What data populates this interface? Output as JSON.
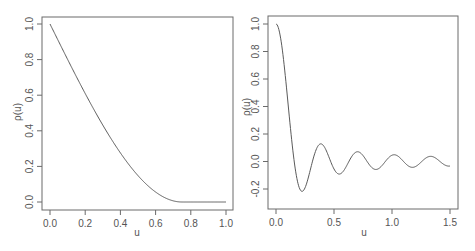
{
  "chart_data": [
    {
      "type": "line",
      "title": "",
      "xlabel": "u",
      "ylabel": "ρ(u)",
      "xlim": [
        0,
        1
      ],
      "ylim": [
        0,
        1
      ],
      "xticks": [
        0.0,
        0.2,
        0.4,
        0.6,
        0.8,
        1.0
      ],
      "xtick_labels": [
        "0.0",
        "0.2",
        "0.4",
        "0.6",
        "0.8",
        "1.0"
      ],
      "yticks": [
        0.0,
        0.2,
        0.4,
        0.6,
        0.8,
        1.0
      ],
      "ytick_labels": [
        "0.0",
        "0.2",
        "0.4",
        "0.6",
        "0.8",
        "1.0"
      ],
      "grid": false,
      "legend": "none",
      "series": [
        {
          "name": "spherical correlation",
          "model": "spherical",
          "range": 0.75,
          "x": [
            0.0,
            0.1,
            0.2,
            0.3,
            0.4,
            0.5,
            0.6,
            0.7,
            0.75,
            0.8,
            0.9,
            1.0
          ],
          "y": [
            1.0,
            0.8,
            0.61,
            0.43,
            0.28,
            0.15,
            0.06,
            0.01,
            0.0,
            0.0,
            0.0,
            0.0
          ]
        }
      ]
    },
    {
      "type": "line",
      "title": "",
      "xlabel": "u",
      "ylabel": "ρ(u)",
      "xlim": [
        0,
        1.5
      ],
      "ylim": [
        -0.3,
        1.0
      ],
      "xticks": [
        0.0,
        0.5,
        1.0,
        1.5
      ],
      "xtick_labels": [
        "0.0",
        "0.5",
        "1.0",
        "1.5"
      ],
      "yticks": [
        -0.2,
        0.0,
        0.2,
        0.4,
        0.6,
        0.8,
        1.0
      ],
      "ytick_labels": [
        "-0.2",
        "0.0",
        "0.2",
        "0.4",
        "0.6",
        "0.8",
        "1.0"
      ],
      "grid": false,
      "legend": "none",
      "series": [
        {
          "name": "damped oscillating correlation",
          "model": "sin(a*u)/(a*u)",
          "a": 20,
          "x": [
            0.0,
            0.05,
            0.1,
            0.157,
            0.224,
            0.3,
            0.38,
            0.46,
            0.545,
            0.7,
            0.86,
            1.02,
            1.18,
            1.34,
            1.5
          ],
          "y": [
            1.0,
            0.84,
            0.45,
            0.0,
            -0.22,
            -0.05,
            0.13,
            0.02,
            -0.09,
            0.07,
            -0.05,
            0.05,
            -0.04,
            0.04,
            -0.03
          ]
        }
      ]
    }
  ]
}
